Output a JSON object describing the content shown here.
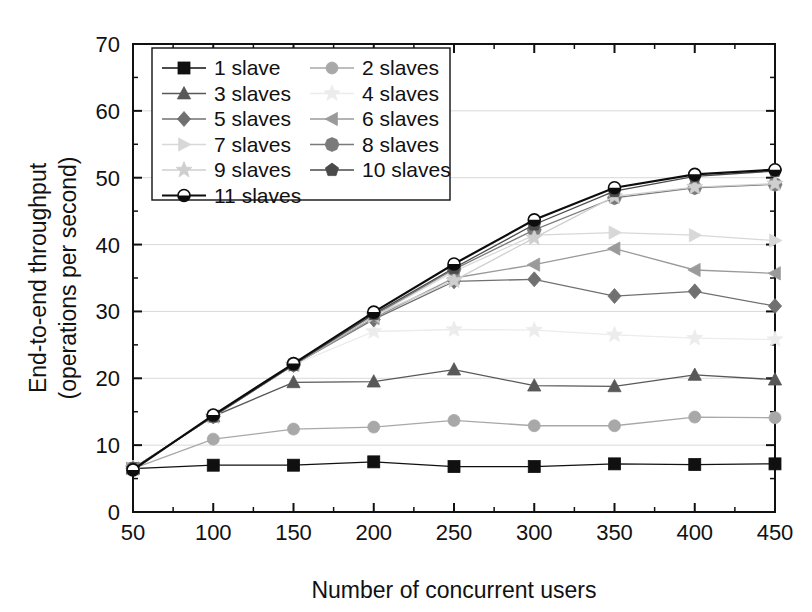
{
  "chart_data": {
    "type": "line",
    "title": "",
    "xlabel": "Number of concurrent users",
    "ylabel": "End-to-end throughput (operations per second)",
    "ylabel_line1": "End-to-end throughput",
    "ylabel_line2": "(operations per second)",
    "x": [
      50,
      100,
      150,
      200,
      250,
      300,
      350,
      400,
      450
    ],
    "xlim": [
      50,
      450
    ],
    "ylim": [
      0,
      70
    ],
    "xticks": [
      50,
      100,
      150,
      200,
      250,
      300,
      350,
      400,
      450
    ],
    "yticks": [
      0,
      10,
      20,
      30,
      40,
      50,
      60,
      70
    ],
    "xtick_labels": [
      "50",
      "100",
      "150",
      "200",
      "250",
      "300",
      "350",
      "400",
      "450"
    ],
    "ytick_labels": [
      "0",
      "10",
      "20",
      "30",
      "40",
      "50",
      "60",
      "70"
    ],
    "x_minor_step": 25,
    "y_minor_step": 5,
    "grid": true,
    "grid_axis": "y",
    "legend_position": "upper-left",
    "series": [
      {
        "name": "1 slave",
        "marker": "square",
        "color": "#101010",
        "values": [
          6.5,
          7.0,
          7.0,
          7.5,
          6.8,
          6.8,
          7.2,
          7.1,
          7.2
        ]
      },
      {
        "name": "2 slaves",
        "marker": "circle",
        "color": "#a8a8a8",
        "values": [
          6.5,
          10.9,
          12.4,
          12.7,
          13.7,
          12.9,
          12.9,
          14.2,
          14.1
        ]
      },
      {
        "name": "3 slaves",
        "marker": "triangle-up",
        "color": "#585858",
        "values": [
          6.5,
          14.3,
          19.4,
          19.5,
          21.3,
          18.9,
          18.8,
          20.5,
          19.8
        ]
      },
      {
        "name": "4 slaves",
        "marker": "star",
        "color": "#ececec",
        "values": [
          6.5,
          14.3,
          22.0,
          27.0,
          27.3,
          27.2,
          26.5,
          26.0,
          25.8
        ]
      },
      {
        "name": "5 slaves",
        "marker": "diamond",
        "color": "#707070",
        "values": [
          6.5,
          14.3,
          22.0,
          28.8,
          34.5,
          34.8,
          32.3,
          33.0,
          30.8
        ]
      },
      {
        "name": "6 slaves",
        "marker": "triangle-left",
        "color": "#9a9a9a",
        "values": [
          6.5,
          14.3,
          22.0,
          29.0,
          35.0,
          37.0,
          39.4,
          36.2,
          35.7
        ]
      },
      {
        "name": "7 slaves",
        "marker": "triangle-right",
        "color": "#d8d8d8",
        "values": [
          6.5,
          14.3,
          22.0,
          29.3,
          36.0,
          41.4,
          41.8,
          41.4,
          40.6
        ]
      },
      {
        "name": "8 slaves",
        "marker": "octagon",
        "color": "#7a7a7a",
        "values": [
          6.5,
          14.3,
          22.0,
          29.4,
          36.3,
          42.2,
          47.0,
          48.5,
          49.0
        ]
      },
      {
        "name": "9 slaves",
        "marker": "star",
        "color": "#cfcfcf",
        "values": [
          6.5,
          14.3,
          22.0,
          29.4,
          34.6,
          41.0,
          47.2,
          48.6,
          49.1
        ]
      },
      {
        "name": "10 slaves",
        "marker": "pentagon",
        "color": "#4a4a4a",
        "values": [
          6.5,
          14.3,
          22.0,
          29.6,
          36.5,
          43.0,
          48.0,
          50.2,
          51.0
        ]
      },
      {
        "name": "11 slaves",
        "marker": "circle-half",
        "color": "#0d0d0d",
        "values": [
          6.3,
          14.5,
          22.2,
          29.9,
          37.1,
          43.7,
          48.5,
          50.5,
          51.2
        ]
      }
    ]
  },
  "legend": {
    "entries": [
      {
        "label": "1 slave"
      },
      {
        "label": "2 slaves"
      },
      {
        "label": "3 slaves"
      },
      {
        "label": "4 slaves"
      },
      {
        "label": "5 slaves"
      },
      {
        "label": "6 slaves"
      },
      {
        "label": "7 slaves"
      },
      {
        "label": "8 slaves"
      },
      {
        "label": "9 slaves"
      },
      {
        "label": "10 slaves"
      },
      {
        "label": "11 slaves"
      }
    ]
  },
  "colors": {
    "axis": "#111111",
    "grid": "#d9d9d9",
    "background": "#ffffff"
  }
}
